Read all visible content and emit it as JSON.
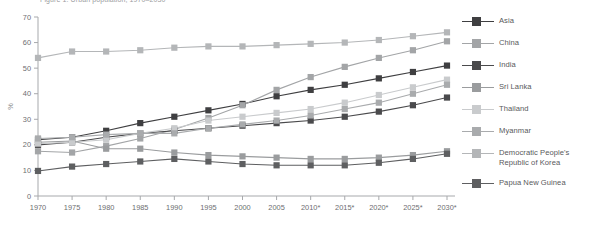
{
  "title": "Figure 1. Urban population, 1970–2030",
  "axes": {
    "ylabel": "%",
    "yticks": [
      "0",
      "10",
      "20",
      "30",
      "40",
      "50",
      "60",
      "70"
    ],
    "xticks": [
      "1970",
      "1975",
      "1980",
      "1985",
      "1990",
      "1995",
      "2000",
      "2005",
      "2010*",
      "2015*",
      "2020*",
      "2025*",
      "2030*"
    ]
  },
  "legend": [
    {
      "label": "Asia",
      "color": "#3f3f41"
    },
    {
      "label": "China",
      "color": "#a3a5a7"
    },
    {
      "label": "India",
      "color": "#4a4a4c"
    },
    {
      "label": "Sri Lanka",
      "color": "#9a9c9e"
    },
    {
      "label": "Thailand",
      "color": "#c9cbcd"
    },
    {
      "label": "Myanmar",
      "color": "#a9abad"
    },
    {
      "label": "Democratic People's\nRepublic of Korea",
      "color": "#b4b6b8"
    },
    {
      "label": "Papua New Guinea",
      "color": "#5e5f61"
    }
  ],
  "chart_data": {
    "type": "line",
    "title": "Urban population, 1970–2030",
    "xlabel": "",
    "ylabel": "%",
    "ylim": [
      0,
      70
    ],
    "grid": false,
    "legend_position": "right",
    "x": [
      "1970",
      "1975",
      "1980",
      "1985",
      "1990",
      "1995",
      "2000",
      "2005",
      "2010*",
      "2015*",
      "2020*",
      "2025*",
      "2030*"
    ],
    "series": [
      {
        "name": "Asia",
        "color": "#3f3f41",
        "values": [
          22.0,
          23.0,
          25.5,
          28.5,
          31.0,
          33.5,
          36.0,
          39.0,
          41.5,
          43.5,
          46.0,
          48.5,
          51.0
        ]
      },
      {
        "name": "China",
        "color": "#a3a5a7",
        "values": [
          17.5,
          17.0,
          19.5,
          22.5,
          26.0,
          30.5,
          35.5,
          41.5,
          46.5,
          50.5,
          54.0,
          57.0,
          60.5
        ]
      },
      {
        "name": "India",
        "color": "#4a4a4c",
        "values": [
          20.0,
          21.0,
          23.0,
          24.5,
          25.5,
          26.5,
          27.5,
          28.5,
          29.5,
          31.0,
          33.0,
          35.5,
          38.5
        ]
      },
      {
        "name": "Sri Lanka",
        "color": "#9a9c9e",
        "values": [
          21.0,
          21.5,
          18.5,
          18.5,
          17.0,
          16.0,
          15.5,
          15.0,
          14.5,
          14.5,
          15.0,
          16.0,
          17.5
        ]
      },
      {
        "name": "Thailand",
        "color": "#c9cbcd",
        "values": [
          20.5,
          21.0,
          22.0,
          24.5,
          26.5,
          29.5,
          31.0,
          32.5,
          34.0,
          36.5,
          39.5,
          42.5,
          45.5
        ]
      },
      {
        "name": "Myanmar",
        "color": "#a9abad",
        "values": [
          22.5,
          23.0,
          24.0,
          24.5,
          24.5,
          26.5,
          28.0,
          29.5,
          31.5,
          34.0,
          36.5,
          40.0,
          43.5
        ]
      },
      {
        "name": "Democratic People's Republic of Korea",
        "color": "#b4b6b8",
        "values": [
          54.0,
          56.5,
          56.5,
          57.0,
          58.0,
          58.5,
          58.5,
          59.0,
          59.5,
          60.0,
          61.0,
          62.5,
          64.0
        ]
      },
      {
        "name": "Papua New Guinea",
        "color": "#5e5f61",
        "values": [
          9.8,
          11.5,
          12.5,
          13.5,
          14.5,
          13.5,
          12.5,
          12.0,
          12.0,
          12.0,
          13.0,
          14.5,
          16.5
        ]
      }
    ]
  }
}
